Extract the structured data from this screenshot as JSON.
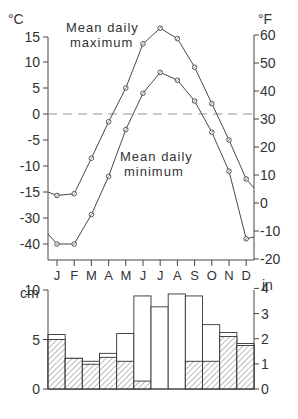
{
  "chart_data": [
    {
      "type": "line",
      "title": "",
      "xlabel": "",
      "ylabel": "°C",
      "ylabel_right": "°F",
      "categories": [
        "J",
        "F",
        "M",
        "A",
        "M",
        "J",
        "J",
        "A",
        "S",
        "O",
        "N",
        "D"
      ],
      "series": [
        {
          "name": "Mean daily maximum",
          "values": [
            -17,
            -16,
            -8.5,
            -1.5,
            5,
            13.5,
            16.5,
            14.5,
            9,
            2,
            -5,
            -12.5
          ]
        },
        {
          "name": "Mean daily minimum",
          "values": [
            -40,
            -40,
            -28,
            -12,
            -3,
            4,
            8,
            6.5,
            2.5,
            -3.5,
            -11,
            -38
          ]
        }
      ],
      "left_ticks": [
        "15",
        "10",
        "5",
        "0",
        "-5",
        "-10",
        "-15",
        "-30",
        "-40"
      ],
      "right_ticks": [
        "60",
        "50",
        "40",
        "30",
        "20",
        "10",
        "0",
        "-10",
        "-20"
      ],
      "annotations": [
        "Mean daily maximum",
        "Mean daily minimum"
      ],
      "reference_line": {
        "value": 0,
        "style": "dashed"
      },
      "grid": false
    },
    {
      "type": "bar",
      "ylabel": "cm",
      "ylabel_right": "in",
      "categories": [
        "J",
        "F",
        "M",
        "A",
        "M",
        "J",
        "J",
        "A",
        "S",
        "O",
        "N",
        "D"
      ],
      "series": [
        {
          "name": "Total precipitation",
          "values": [
            5.5,
            3.1,
            2.8,
            3.6,
            5.6,
            9.4,
            8.3,
            9.6,
            9.4,
            6.5,
            5.7,
            4.6
          ]
        },
        {
          "name": "Snowfall (hatched, water equivalent)",
          "values": [
            5.0,
            3.1,
            2.5,
            3.2,
            2.8,
            0.8,
            0,
            0,
            2.8,
            2.8,
            5.3,
            4.4
          ]
        }
      ],
      "left_ticks": [
        "10",
        "5",
        "0"
      ],
      "right_ticks": [
        "4",
        "3",
        "2",
        "1",
        "0"
      ],
      "ylim": [
        0,
        10
      ]
    }
  ],
  "labels": {
    "unit_c": "°C",
    "unit_f": "°F",
    "unit_cm": "cm",
    "unit_in": "in",
    "max_line1": "Mean daily",
    "max_line2": "maximum",
    "min_line1": "Mean daily",
    "min_line2": "minimum"
  }
}
